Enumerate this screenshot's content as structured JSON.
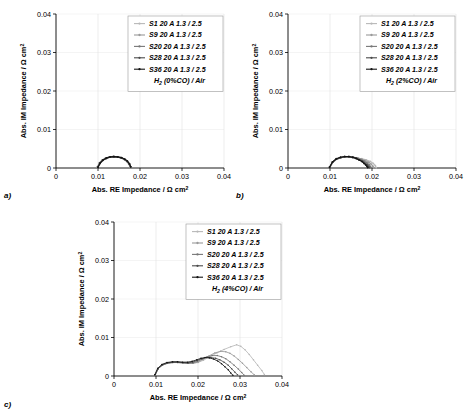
{
  "figure": {
    "type": "nyquist-impedance-multi-panel",
    "panel_count": 3,
    "axis": {
      "xlabel_prefix": "Abs. RE Impedance / ",
      "xlabel_unit_omega": "Ω cm",
      "xlabel_unit_sup": "2",
      "ylabel_prefix": "Abs. IM Impedance / ",
      "ylabel_unit_omega": "Ω cm",
      "ylabel_unit_sup": "2",
      "xticks": [
        "0",
        "0.01",
        "0.02",
        "0.03",
        "0.04"
      ],
      "yticks": [
        "0",
        "0.01",
        "0.02",
        "0.03",
        "0.04"
      ],
      "xlim": [
        0,
        0.04
      ],
      "ylim": [
        0,
        0.04
      ],
      "grid": "light vertical and horizontal gridlines"
    },
    "legend_series": [
      "S1 20 A 1.3 / 2.5",
      "S9 20 A 1.3 / 2.5",
      "S20 20 A 1.3 / 2.5",
      "S28 20 A 1.3 / 2.5",
      "S36 20 A 1.3 / 2.5"
    ],
    "series_colors": [
      "#b8b8b8",
      "#9a9a9a",
      "#777777",
      "#4a4a4a",
      "#141414"
    ]
  },
  "panels": [
    {
      "id": "a",
      "panel_label": "a)",
      "condition_prefix": "H",
      "condition_sub": "2",
      "condition_suffix": " (0%CO) / Air",
      "chart_data": {
        "type": "line",
        "title": "H2 (0%CO) / Air",
        "xlabel": "Abs. RE Impedance / Ω cm2",
        "ylabel": "Abs. IM Impedance / Ω cm2",
        "xlim": [
          0,
          0.04
        ],
        "ylim": [
          0,
          0.04
        ],
        "grid": true,
        "legend_position": "top-right",
        "series": [
          {
            "name": "S1 20 A 1.3 / 2.5",
            "x": [
              0.0099,
              0.0104,
              0.0111,
              0.0119,
              0.0128,
              0.0137,
              0.0146,
              0.0155,
              0.0163,
              0.0169,
              0.0174,
              0.0177
            ],
            "y": [
              0.0002,
              0.0013,
              0.0021,
              0.0026,
              0.0029,
              0.003,
              0.0029,
              0.0027,
              0.0023,
              0.0018,
              0.0011,
              0.0003
            ]
          },
          {
            "name": "S9 20 A 1.3 / 2.5",
            "x": [
              0.0098,
              0.0103,
              0.011,
              0.0118,
              0.0127,
              0.0136,
              0.0145,
              0.0154,
              0.0162,
              0.0168,
              0.0173,
              0.0176
            ],
            "y": [
              0.0002,
              0.0013,
              0.0021,
              0.0026,
              0.0029,
              0.003,
              0.0029,
              0.0027,
              0.0023,
              0.0018,
              0.0011,
              0.0003
            ]
          },
          {
            "name": "S20 20 A 1.3 / 2.5",
            "x": [
              0.0099,
              0.0104,
              0.0111,
              0.0119,
              0.0128,
              0.0137,
              0.0146,
              0.0155,
              0.0163,
              0.0169,
              0.0174,
              0.0177
            ],
            "y": [
              0.0002,
              0.0012,
              0.002,
              0.0025,
              0.0028,
              0.0029,
              0.0028,
              0.0026,
              0.0022,
              0.0017,
              0.001,
              0.0003
            ]
          },
          {
            "name": "S28 20 A 1.3 / 2.5",
            "x": [
              0.01,
              0.0105,
              0.0112,
              0.012,
              0.0129,
              0.0138,
              0.0147,
              0.0156,
              0.0164,
              0.017,
              0.0175,
              0.0178
            ],
            "y": [
              0.0002,
              0.0012,
              0.002,
              0.0025,
              0.0028,
              0.0029,
              0.0028,
              0.0026,
              0.0022,
              0.0017,
              0.001,
              0.0003
            ]
          },
          {
            "name": "S36 20 A 1.3 / 2.5",
            "x": [
              0.01,
              0.0105,
              0.0112,
              0.012,
              0.0129,
              0.0138,
              0.0147,
              0.0156,
              0.0164,
              0.017,
              0.0175,
              0.0178
            ],
            "y": [
              0.0002,
              0.0013,
              0.0021,
              0.0026,
              0.0029,
              0.003,
              0.0029,
              0.0027,
              0.0023,
              0.0018,
              0.0011,
              0.0003
            ]
          }
        ]
      }
    },
    {
      "id": "b",
      "panel_label": "b)",
      "condition_prefix": "H",
      "condition_sub": "2",
      "condition_suffix": " (2%CO) / Air",
      "chart_data": {
        "type": "line",
        "title": "H2 (2%CO) / Air",
        "xlabel": "Abs. RE Impedance / Ω cm2",
        "ylabel": "Abs. IM Impedance / Ω cm2",
        "xlim": [
          0,
          0.04
        ],
        "ylim": [
          0,
          0.04
        ],
        "grid": true,
        "legend_position": "top-right",
        "series": [
          {
            "name": "S1 20 A 1.3 / 2.5",
            "x": [
              0.01,
              0.0107,
              0.0116,
              0.0126,
              0.0136,
              0.0146,
              0.0156,
              0.0166,
              0.0176,
              0.0186,
              0.0196,
              0.0203,
              0.0208,
              0.021
            ],
            "y": [
              0.0002,
              0.0015,
              0.0023,
              0.0027,
              0.0029,
              0.0029,
              0.0028,
              0.0026,
              0.0024,
              0.0021,
              0.0017,
              0.0012,
              0.0006,
              0.0001
            ]
          },
          {
            "name": "S9 20 A 1.3 / 2.5",
            "x": [
              0.01,
              0.0107,
              0.0116,
              0.0126,
              0.0136,
              0.0146,
              0.0156,
              0.0166,
              0.0175,
              0.0184,
              0.0192,
              0.0198,
              0.0202,
              0.0204
            ],
            "y": [
              0.0002,
              0.0015,
              0.0023,
              0.0027,
              0.0029,
              0.0029,
              0.0028,
              0.0026,
              0.0023,
              0.0019,
              0.0015,
              0.001,
              0.0005,
              0.0001
            ]
          },
          {
            "name": "S20 20 A 1.3 / 2.5",
            "x": [
              0.0099,
              0.0106,
              0.0115,
              0.0125,
              0.0135,
              0.0145,
              0.0155,
              0.0164,
              0.0173,
              0.0181,
              0.0188,
              0.0193,
              0.0196,
              0.0198
            ],
            "y": [
              0.0002,
              0.0015,
              0.0023,
              0.0027,
              0.0029,
              0.0029,
              0.0028,
              0.0025,
              0.0022,
              0.0018,
              0.0013,
              0.0009,
              0.0004,
              0.0001
            ]
          },
          {
            "name": "S28 20 A 1.3 / 2.5",
            "x": [
              0.0099,
              0.0106,
              0.0115,
              0.0125,
              0.0135,
              0.0145,
              0.0154,
              0.0163,
              0.0171,
              0.0178,
              0.0184,
              0.0189,
              0.0192,
              0.0194
            ],
            "y": [
              0.0002,
              0.0015,
              0.0023,
              0.0027,
              0.0029,
              0.0029,
              0.0027,
              0.0025,
              0.0021,
              0.0017,
              0.0012,
              0.0008,
              0.0004,
              0.0001
            ]
          },
          {
            "name": "S36 20 A 1.3 / 2.5",
            "x": [
              0.0099,
              0.0106,
              0.0115,
              0.0125,
              0.0135,
              0.0145,
              0.0154,
              0.0162,
              0.0169,
              0.0176,
              0.0181,
              0.0185,
              0.0188,
              0.019
            ],
            "y": [
              0.0002,
              0.0016,
              0.0024,
              0.0028,
              0.003,
              0.003,
              0.0028,
              0.0025,
              0.0021,
              0.0017,
              0.0012,
              0.0008,
              0.0004,
              0.0001
            ]
          }
        ]
      }
    },
    {
      "id": "c",
      "panel_label": "c)",
      "condition_prefix": "H",
      "condition_sub": "2",
      "condition_suffix": " (4%CO) / Air",
      "chart_data": {
        "type": "line",
        "title": "H2 (4%CO) / Air",
        "xlabel": "Abs. RE Impedance / Ω cm2",
        "ylabel": "Abs. IM Impedance / Ω cm2",
        "xlim": [
          0,
          0.04
        ],
        "ylim": [
          0,
          0.04
        ],
        "grid": true,
        "legend_position": "top-right",
        "series": [
          {
            "name": "S1 20 A 1.3 / 2.5",
            "x": [
              0.0098,
              0.0105,
              0.0115,
              0.0127,
              0.014,
              0.0152,
              0.0164,
              0.0176,
              0.0188,
              0.02,
              0.0213,
              0.0228,
              0.0245,
              0.0262,
              0.0278,
              0.0292,
              0.0302,
              0.0312,
              0.0322,
              0.0332,
              0.0342,
              0.0352,
              0.0358
            ],
            "y": [
              0.0003,
              0.0019,
              0.0028,
              0.0033,
              0.0035,
              0.0035,
              0.0034,
              0.0033,
              0.0033,
              0.0035,
              0.0041,
              0.005,
              0.006,
              0.0069,
              0.0076,
              0.0081,
              0.0077,
              0.0068,
              0.0056,
              0.0042,
              0.0028,
              0.0014,
              0.0004
            ]
          },
          {
            "name": "S9 20 A 1.3 / 2.5",
            "x": [
              0.0098,
              0.0105,
              0.0115,
              0.0127,
              0.014,
              0.0152,
              0.0164,
              0.0176,
              0.0188,
              0.02,
              0.0212,
              0.0226,
              0.024,
              0.0254,
              0.0266,
              0.0276,
              0.0286,
              0.0296,
              0.0306,
              0.0316,
              0.0326,
              0.0334
            ],
            "y": [
              0.0003,
              0.0019,
              0.0028,
              0.0033,
              0.0035,
              0.0035,
              0.0034,
              0.0033,
              0.0033,
              0.0036,
              0.0043,
              0.0052,
              0.006,
              0.0064,
              0.0063,
              0.0059,
              0.0052,
              0.0043,
              0.0033,
              0.0022,
              0.0011,
              0.0003
            ]
          },
          {
            "name": "S20 20 A 1.3 / 2.5",
            "x": [
              0.0098,
              0.0105,
              0.0115,
              0.0127,
              0.014,
              0.0152,
              0.0164,
              0.0176,
              0.0188,
              0.0199,
              0.021,
              0.0222,
              0.0234,
              0.0246,
              0.0256,
              0.0266,
              0.0276,
              0.0286,
              0.0296,
              0.0304,
              0.031
            ],
            "y": [
              0.0003,
              0.0019,
              0.0028,
              0.0033,
              0.0035,
              0.0035,
              0.0034,
              0.0033,
              0.0034,
              0.0038,
              0.0044,
              0.005,
              0.0053,
              0.0053,
              0.005,
              0.0045,
              0.0037,
              0.0028,
              0.0018,
              0.0009,
              0.0002
            ]
          },
          {
            "name": "S28 20 A 1.3 / 2.5",
            "x": [
              0.0098,
              0.0105,
              0.0115,
              0.0127,
              0.014,
              0.0152,
              0.0164,
              0.0176,
              0.0187,
              0.0198,
              0.0209,
              0.022,
              0.0231,
              0.0242,
              0.0252,
              0.0262,
              0.0272,
              0.028,
              0.0288,
              0.0294
            ],
            "y": [
              0.0003,
              0.0019,
              0.0029,
              0.0034,
              0.0036,
              0.0036,
              0.0035,
              0.0034,
              0.0036,
              0.004,
              0.0045,
              0.0048,
              0.0048,
              0.0046,
              0.0042,
              0.0036,
              0.0028,
              0.0019,
              0.001,
              0.0003
            ]
          },
          {
            "name": "S36 20 A 1.3 / 2.5",
            "x": [
              0.0097,
              0.0104,
              0.0114,
              0.0126,
              0.0139,
              0.0151,
              0.0163,
              0.0175,
              0.0186,
              0.0197,
              0.0207,
              0.0217,
              0.0227,
              0.0237,
              0.0247,
              0.0256,
              0.0264,
              0.0272,
              0.0278,
              0.0283
            ],
            "y": [
              0.0003,
              0.002,
              0.003,
              0.0035,
              0.0037,
              0.0037,
              0.0036,
              0.0036,
              0.0038,
              0.0042,
              0.0046,
              0.0048,
              0.0047,
              0.0044,
              0.0039,
              0.0032,
              0.0024,
              0.0016,
              0.0008,
              0.0002
            ]
          }
        ]
      }
    }
  ]
}
